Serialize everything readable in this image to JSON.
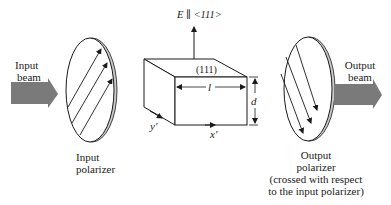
{
  "diagram": {
    "input_beam": {
      "line1": "Input",
      "line2": "beam"
    },
    "input_polarizer": {
      "line1": "Input",
      "line2": "polarizer"
    },
    "field_label": "E ∥ <111>",
    "crystal_face": "(111)",
    "length_label": "l",
    "thickness_label": "d",
    "y_axis_label": "y′",
    "x_axis_label": "x′",
    "output_polarizer": {
      "line1": "Output",
      "line2": "polarizer",
      "line3": "(crossed with respect",
      "line4": "to the input polarizer)"
    },
    "output_beam": {
      "line1": "Output",
      "line2": "beam"
    },
    "colors": {
      "beam_arrow": "#7a7a7a",
      "line": "#1a1a1a",
      "polarizer_rim": "#bdbdbd"
    }
  }
}
